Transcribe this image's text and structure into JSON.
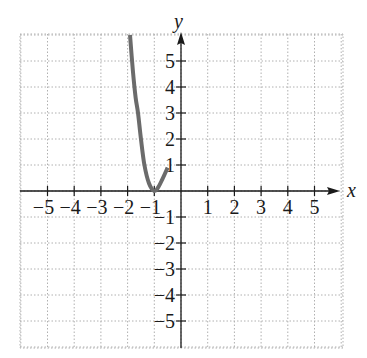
{
  "header_fragment": "y = ... graph",
  "chart_data": {
    "type": "line",
    "title": "",
    "xlabel": "x",
    "ylabel": "y",
    "xlim": [
      -6,
      6
    ],
    "ylim": [
      -6,
      6
    ],
    "grid": true,
    "grid_style": "dotted",
    "x_ticks": [
      -5,
      -4,
      -3,
      -2,
      -1,
      1,
      2,
      3,
      4,
      5
    ],
    "y_ticks": [
      -5,
      -4,
      -3,
      -2,
      -1,
      1,
      2,
      3,
      4,
      5
    ],
    "x_tick_labels": [
      "−5",
      "−4",
      "−3",
      "−2",
      "−1",
      "1",
      "2",
      "3",
      "4",
      "5"
    ],
    "y_tick_labels": [
      "−5",
      "−4",
      "−3",
      "−2",
      "−1",
      "1",
      "2",
      "3",
      "4",
      "5"
    ],
    "series": [
      {
        "name": "curve",
        "color": "#6b6b6b",
        "x": [
          -1.91,
          -1.8,
          -1.7,
          -1.61,
          -1.5,
          -1.37,
          -1.2,
          -1.0,
          -0.85,
          -0.7,
          -0.5
        ],
        "y": [
          6.0,
          4.6,
          3.6,
          3.0,
          2.0,
          1.0,
          0.3,
          0.0,
          0.15,
          0.45,
          0.9
        ]
      }
    ],
    "axis_color": "#1a1a1a",
    "grid_color": "#b0b0b0"
  }
}
